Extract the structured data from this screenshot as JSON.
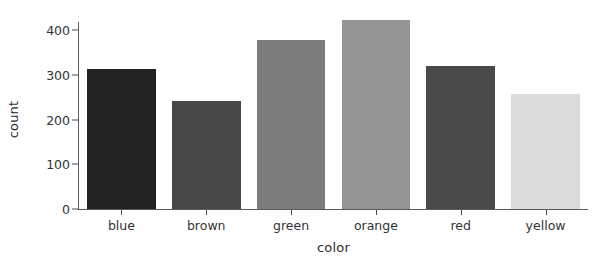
{
  "chart_data": {
    "type": "bar",
    "title": "",
    "xlabel": "color",
    "ylabel": "count",
    "categories": [
      "blue",
      "brown",
      "green",
      "orange",
      "red",
      "yellow"
    ],
    "values": [
      313,
      242,
      378,
      423,
      320,
      258
    ],
    "bar_colors": [
      "#222222",
      "#474747",
      "#7d7d7d",
      "#949494",
      "#4a4a4a",
      "#dcdcdc"
    ],
    "ylim": [
      0,
      440
    ],
    "y_ticks": [
      0,
      100,
      200,
      300,
      400
    ],
    "y_tick_labels": [
      "0",
      "100",
      "200",
      "300",
      "400"
    ],
    "x_tick_labels": [
      "blue",
      "brown",
      "green",
      "orange",
      "red",
      "yellow"
    ],
    "grid": false,
    "legend": false,
    "legend_position": "none",
    "background": "#ffffff",
    "axis_color": "#5a5a5a",
    "text_color": "#333333"
  }
}
